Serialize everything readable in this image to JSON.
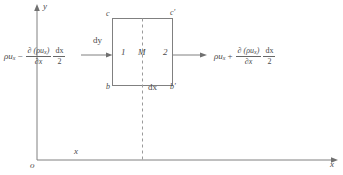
{
  "figure": {
    "axes": {
      "y_label": "y",
      "x_label": "x",
      "x_mid_label": "x",
      "origin_label": "o"
    },
    "element": {
      "corner_top_left": "c",
      "corner_top_right": "c′",
      "corner_bottom_left": "b",
      "corner_bottom_right": "b′",
      "face_left": "1",
      "center": "M",
      "face_right": "2",
      "height_label": "dy",
      "width_label": "dx"
    },
    "flux_in": {
      "base": "ρu",
      "base_sub": "x",
      "operator": "−",
      "derivative_num": "∂ (ρu",
      "derivative_num_sub": "x",
      "derivative_num_tail": ")",
      "derivative_den": "∂x",
      "step_num": "dx",
      "step_den": "2"
    },
    "flux_out": {
      "base": "ρu",
      "base_sub": "x",
      "operator": "+",
      "derivative_num": "∂ (ρu",
      "derivative_num_sub": "x",
      "derivative_num_tail": ")",
      "derivative_den": "∂x",
      "step_num": "dx",
      "step_den": "2"
    },
    "colors": {
      "line": "#808080",
      "text": "#4a4a4a",
      "background": "#ffffff"
    }
  }
}
